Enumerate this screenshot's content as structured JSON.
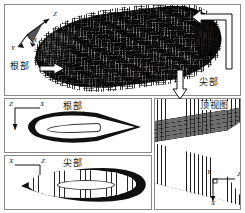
{
  "figure": {
    "type": "cfd-mesh-figure",
    "panels": [
      {
        "id": "main",
        "name": "3d-blade-mesh-view",
        "description": "3D structured surface mesh of a blade",
        "axes": {
          "x": "X",
          "y": "Y",
          "z": "Z"
        },
        "annotations": [
          {
            "label": "根部",
            "meaning": "root",
            "arrow": "right"
          },
          {
            "label": "尖部",
            "meaning": "tip",
            "arrow": "left-bracket"
          }
        ]
      },
      {
        "id": "root",
        "name": "root-section-view",
        "title": "根部",
        "axes": {
          "top_left": "Z",
          "horizontal": "X",
          "vertical": "Y"
        }
      },
      {
        "id": "tip",
        "name": "tip-section-view",
        "title": "尖部",
        "axes": {
          "top_left": "X",
          "horizontal": "Z",
          "vertical": "Y"
        }
      },
      {
        "id": "top",
        "name": "top-view",
        "title": "顶视图",
        "axes": {
          "vertical_up": "Y",
          "horizontal": "Z",
          "vertical_down": "X"
        }
      }
    ]
  },
  "labels": {
    "root": "根部",
    "tip": "尖部",
    "top_view": "顶视图",
    "axis_x": "X",
    "axis_y": "Y",
    "axis_z": "Z"
  },
  "colors": {
    "mesh_dark": "#0b0a09",
    "mesh_mid": "#6e6e6e",
    "grid_line": "#1c1c1c",
    "frame": "#888888",
    "background": "#ffffff",
    "text": "#111111"
  }
}
